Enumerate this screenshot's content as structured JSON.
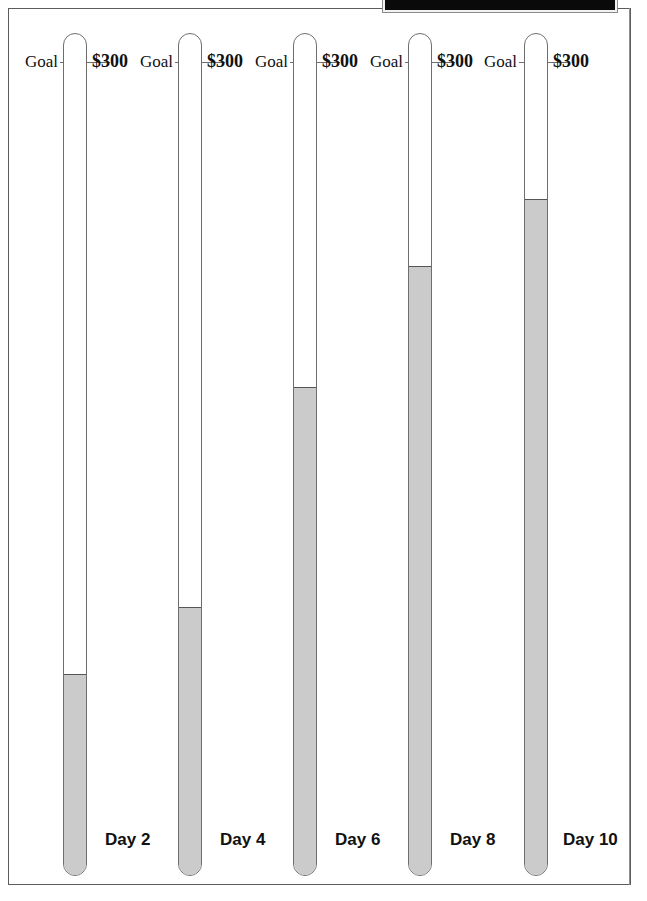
{
  "page": {
    "frame_border_color": "#5c5c5c",
    "background": "#ffffff"
  },
  "top_bar": {
    "present": true,
    "color": "#0a0a0a"
  },
  "chart_data": {
    "type": "bar",
    "title": "",
    "subtitle": "",
    "xlabel": "",
    "ylabel": "",
    "orientation": "vertical",
    "grid": false,
    "legend_position": "none",
    "style": "thermometer-gauge",
    "goal_label": "Goal",
    "goal_value_label": "$300",
    "goal_value": 300,
    "ylim": [
      0,
      300
    ],
    "fill_color": "#cbcbcb",
    "outline_color": "#6e6e6e",
    "categories": [
      "Day 2",
      "Day 4",
      "Day 6",
      "Day 8",
      "Day 10"
    ],
    "values": [
      60,
      100,
      180,
      240,
      270
    ],
    "percent_filled": [
      20,
      33,
      60,
      80,
      90
    ],
    "thermometers": [
      {
        "day_label": "Day 2",
        "goal_label": "Goal",
        "amount_label": "$300",
        "value": 60,
        "percent": 20
      },
      {
        "day_label": "Day 4",
        "goal_label": "Goal",
        "amount_label": "$300",
        "value": 100,
        "percent": 33
      },
      {
        "day_label": "Day 6",
        "goal_label": "Goal",
        "amount_label": "$300",
        "value": 180,
        "percent": 60
      },
      {
        "day_label": "Day 8",
        "goal_label": "Goal",
        "amount_label": "$300",
        "value": 240,
        "percent": 80
      },
      {
        "day_label": "Day 10",
        "goal_label": "Goal",
        "amount_label": "$300",
        "value": 270,
        "percent": 90
      }
    ]
  },
  "thermometers": [
    {
      "goal_label": "Goal",
      "amount_label": "$300",
      "day_label": "Day 2"
    },
    {
      "goal_label": "Goal",
      "amount_label": "$300",
      "day_label": "Day 4"
    },
    {
      "goal_label": "Goal",
      "amount_label": "$300",
      "day_label": "Day 6"
    },
    {
      "goal_label": "Goal",
      "amount_label": "$300",
      "day_label": "Day 8"
    },
    {
      "goal_label": "Goal",
      "amount_label": "$300",
      "day_label": "Day 10"
    }
  ],
  "layout": {
    "tube_top": 33,
    "tube_bottom": 876,
    "tube_width": 24,
    "tube_x": [
      63,
      178,
      293,
      408,
      524
    ],
    "goal_tick_y": 62,
    "fill_top_y": [
      675,
      608,
      388,
      267,
      200
    ],
    "label_baseline_y": 62,
    "day_label_y": 840
  }
}
